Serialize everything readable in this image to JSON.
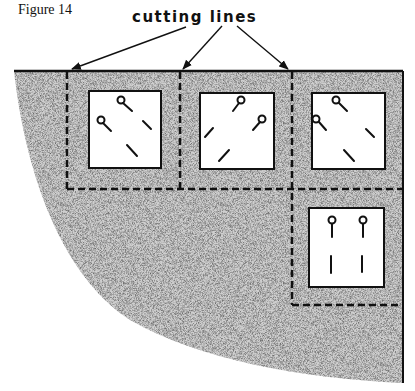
{
  "figure": {
    "label": "Figure 14",
    "callout_text": "cutting lines"
  },
  "diagram": {
    "pieces": [
      {
        "id": "piece-1",
        "pins": 2,
        "slashes": 2
      },
      {
        "id": "piece-2",
        "pins": 2,
        "slashes": 2
      },
      {
        "id": "piece-3",
        "pins": 2,
        "slashes": 2
      },
      {
        "id": "piece-4",
        "pins": 2,
        "slashes": 2
      }
    ],
    "colors": {
      "ink": "#111111",
      "stipple": "#8a8a8a",
      "paper": "#ffffff"
    }
  }
}
